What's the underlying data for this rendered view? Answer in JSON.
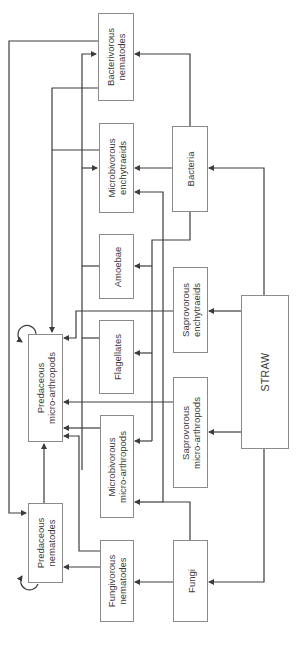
{
  "diagram": {
    "type": "food-web",
    "orientation": "rotated-90-ccw",
    "colors": {
      "line": "#3c3c3c",
      "box_border": "#8a8a8a",
      "text": "#3a3a3a",
      "background": "#ffffff"
    },
    "nodes": {
      "bacterivorous_nematodes": "Bacterivorous\nnematodes",
      "microbivorous_enchytraeids": "Microbivorous\nenchytraeids",
      "bacteria": "Bacteria",
      "amoebae": "Amoebae",
      "saprovorous_enchytraeids": "Saprovorous\nenchytraeids",
      "flagellates": "Flagellates",
      "predaceous_micro_arthropods": "Predaceous\nmicro-arthropods",
      "straw": "STRAW",
      "saprovorous_micro_arthropods": "Saprovorous\nmicro-arthropods",
      "microbivorous_micro_arthropods": "Microbivorous\nmicro-arthropods",
      "predaceous_nematodes": "Predaceous\nnematodes",
      "fungivorous_nematodes": "Fungivorous\nnematodes",
      "fungi": "Fungi"
    },
    "edges": [
      {
        "from": "STRAW",
        "to": "Bacteria"
      },
      {
        "from": "STRAW",
        "to": "Fungi"
      },
      {
        "from": "STRAW",
        "to": "Saprovorous enchytraeids"
      },
      {
        "from": "STRAW",
        "to": "Saprovorous micro-arthropods"
      },
      {
        "from": "Bacteria",
        "to": "Bacterivorous nematodes"
      },
      {
        "from": "Bacteria",
        "to": "Microbivorous enchytraeids"
      },
      {
        "from": "Bacteria",
        "to": "Amoebae"
      },
      {
        "from": "Bacteria",
        "to": "Flagellates"
      },
      {
        "from": "Bacteria",
        "to": "Microbivorous micro-arthropods"
      },
      {
        "from": "Fungi",
        "to": "Fungivorous nematodes"
      },
      {
        "from": "Fungi",
        "to": "Microbivorous micro-arthropods"
      },
      {
        "from": "Fungi",
        "to": "Microbivorous enchytraeids"
      },
      {
        "from": "Bacterivorous nematodes",
        "to": "Predaceous nematodes"
      },
      {
        "from": "Bacterivorous nematodes",
        "to": "Predaceous micro-arthropods"
      },
      {
        "from": "Microbivorous enchytraeids",
        "to": "Predaceous micro-arthropods"
      },
      {
        "from": "Amoebae",
        "to": "Predaceous micro-arthropods"
      },
      {
        "from": "Flagellates",
        "to": "Predaceous micro-arthropods"
      },
      {
        "from": "Saprovorous enchytraeids",
        "to": "Predaceous micro-arthropods"
      },
      {
        "from": "Saprovorous micro-arthropods",
        "to": "Predaceous micro-arthropods"
      },
      {
        "from": "Microbivorous micro-arthropods",
        "to": "Predaceous micro-arthropods"
      },
      {
        "from": "Fungivorous nematodes",
        "to": "Predaceous micro-arthropods"
      },
      {
        "from": "Fungivorous nematodes",
        "to": "Predaceous nematodes"
      },
      {
        "from": "Predaceous nematodes",
        "to": "Predaceous micro-arthropods"
      },
      {
        "from": "Predaceous micro-arthropods",
        "to": "Predaceous micro-arthropods",
        "kind": "self-loop"
      },
      {
        "from": "Predaceous nematodes",
        "to": "Predaceous nematodes",
        "kind": "self-loop"
      }
    ]
  }
}
